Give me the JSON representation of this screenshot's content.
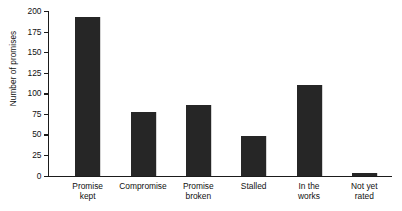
{
  "chart_data": {
    "type": "bar",
    "title": "",
    "xlabel": "",
    "ylabel": "Number of promises",
    "categories": [
      "Promise kept",
      "Compromise",
      "Promise broken",
      "Stalled",
      "In the works",
      "Not yet rated"
    ],
    "category_lines": [
      [
        "Promise",
        "kept"
      ],
      [
        "Compromise"
      ],
      [
        "Promise",
        "broken"
      ],
      [
        "Stalled"
      ],
      [
        "In the",
        "works"
      ],
      [
        "Not yet",
        "rated"
      ]
    ],
    "values": [
      193,
      77,
      86,
      48,
      110,
      3
    ],
    "ylim": [
      0,
      200
    ],
    "yticks": [
      0,
      25,
      50,
      75,
      100,
      125,
      150,
      175,
      200
    ],
    "ytick_labels": [
      "0",
      "25",
      "50",
      "75",
      "100",
      "125",
      "150",
      "175",
      "200"
    ],
    "grid": false,
    "legend": false,
    "bar_color": "#262626",
    "axis_color": "#1b1b1b",
    "background_color": "#ffffff"
  }
}
